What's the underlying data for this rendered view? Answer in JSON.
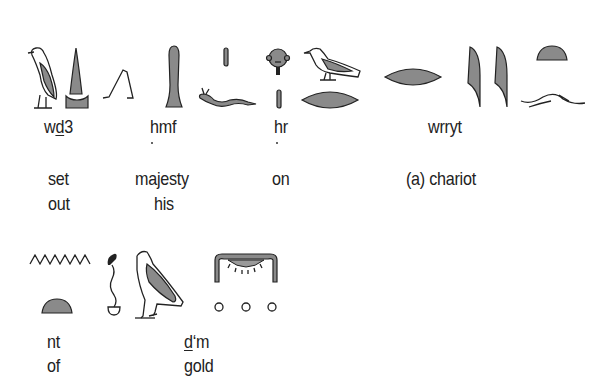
{
  "row1": {
    "groups": [
      {
        "translit_pre": "w",
        "translit_under": "d",
        "translit_post": "3",
        "gloss_line1": "set",
        "gloss_line2": "out",
        "glyphs": [
          "vulture-bird",
          "loaf-on-stand",
          "walking-legs"
        ]
      },
      {
        "translit": "hmf",
        "dot_under_h": true,
        "gloss_line1": "majesty",
        "gloss_line2": "his",
        "glyphs": [
          "club",
          "stroke",
          "horned-viper"
        ]
      },
      {
        "translit": "hr",
        "dot_under_h": true,
        "gloss_line1": "on",
        "glyphs": [
          "face",
          "stroke"
        ]
      },
      {
        "translit": "wrryt",
        "gloss_line1": "(a) chariot",
        "glyphs": [
          "quail-chick-bird",
          "mouth",
          "mouth",
          "reed-leaf",
          "reed-leaf",
          "bread-loaf",
          "land-strip"
        ]
      }
    ]
  },
  "row2": {
    "groups": [
      {
        "translit": "nt",
        "gloss_line1": "of",
        "glyphs": [
          "water-ripple",
          "bread-loaf"
        ]
      },
      {
        "translit_under": "d",
        "translit_post": "‘m",
        "gloss_line1": "gold",
        "glyphs": [
          "cobra-rope",
          "falcon",
          "gold-collar",
          "three-grains"
        ]
      }
    ]
  },
  "colors": {
    "glyph_fill": "#8a8a8a",
    "ink": "#222222",
    "background": "#ffffff"
  }
}
